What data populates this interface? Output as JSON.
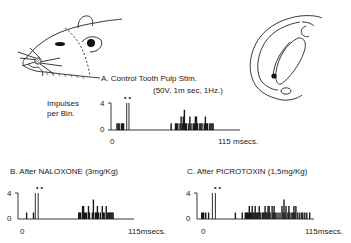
{
  "figure": {
    "panel_a": {
      "title": "A.  Control  Tooth  Pulp  Stim.",
      "params": "(50V, 1m sec, 1Hz.)",
      "ylabel_line1": "Impulses",
      "ylabel_line2": "per Bin.",
      "y_max_label": "4",
      "y_min_label": "0",
      "x_start_label": "0",
      "x_end_label": "115 msecs.",
      "stimulus_markers": "• •"
    },
    "panel_b": {
      "title": "B.  After NALOXONE  (3mg/Kg)",
      "y_max_label": "4",
      "y_min_label": "0",
      "x_start_label": "0",
      "x_end_label": "115msecs.",
      "stimulus_markers": "• •"
    },
    "panel_c": {
      "title": "C. After PICROTOXIN  (1,5mg/Kg)",
      "y_max_label": "4",
      "y_min_label": "0",
      "x_start_label": "0",
      "x_end_label": "115msecs.",
      "stimulus_markers": "• •"
    },
    "illustrations": {
      "left": "rat-head-drawing",
      "right": "brain-section-drawing"
    }
  },
  "chart_data": [
    {
      "type": "bar",
      "title": "A. Control Tooth Pulp Stim. (50V, 1m sec, 1Hz.)",
      "xlabel": "msecs",
      "ylabel": "Impulses per Bin.",
      "xlim": [
        0,
        115
      ],
      "ylim": [
        0,
        4
      ],
      "note": "Two stimulus artifacts (marked ••) reach 4; late response cluster ~55-95 msec with 1-2 impulses per bin",
      "bins_ms": [
        3,
        4,
        5,
        7,
        8,
        9,
        12,
        14,
        52,
        56,
        57,
        58,
        60,
        61,
        62,
        63,
        64,
        65,
        66,
        68,
        69,
        70,
        72,
        73,
        74,
        75,
        76,
        78,
        79,
        80,
        82,
        83,
        84,
        85,
        87,
        88,
        89,
        90
      ],
      "values": [
        1,
        1,
        1,
        1,
        1,
        1,
        4,
        4,
        1,
        1,
        1,
        1,
        1,
        2,
        1,
        2,
        3,
        1,
        1,
        1,
        2,
        1,
        1,
        1,
        2,
        2,
        1,
        1,
        1,
        1,
        1,
        2,
        1,
        1,
        1,
        1,
        1,
        1
      ]
    },
    {
      "type": "bar",
      "title": "B. After NALOXONE (3mg/Kg)",
      "xlabel": "msecs",
      "ylabel": "Impulses per Bin.",
      "xlim": [
        0,
        115
      ],
      "ylim": [
        0,
        4
      ],
      "bins_ms": [
        5,
        12,
        14,
        17,
        58,
        59,
        60,
        62,
        63,
        64,
        65,
        66,
        68,
        69,
        72,
        73,
        75,
        76,
        77,
        78,
        80,
        82,
        83,
        84,
        86,
        87,
        88,
        89,
        90,
        91,
        92,
        93
      ],
      "values": [
        1,
        1,
        4,
        4,
        1,
        1,
        1,
        2,
        2,
        1,
        1,
        1,
        2,
        1,
        1,
        3,
        1,
        1,
        2,
        1,
        1,
        2,
        1,
        1,
        2,
        1,
        1,
        1,
        1,
        1,
        1,
        1
      ]
    },
    {
      "type": "bar",
      "title": "C. After PICROTOXIN (1,5mg/Kg)",
      "xlabel": "msecs",
      "ylabel": "Impulses per Bin.",
      "xlim": [
        0,
        115
      ],
      "ylim": [
        0,
        4
      ],
      "bins_ms": [
        1,
        2,
        3,
        5,
        8,
        12,
        15,
        35,
        42,
        45,
        46,
        47,
        48,
        49,
        50,
        51,
        52,
        53,
        54,
        55,
        56,
        57,
        58,
        59,
        60,
        62,
        63,
        64,
        65,
        66,
        67,
        68,
        69,
        70,
        72,
        73,
        74,
        75,
        76,
        78,
        80,
        82,
        83,
        84,
        85,
        86,
        88,
        89,
        90,
        92,
        93,
        94,
        95,
        96,
        98,
        100,
        102,
        103,
        105,
        107,
        110
      ],
      "values": [
        1,
        1,
        1,
        1,
        1,
        4,
        4,
        1,
        1,
        1,
        1,
        1,
        1,
        2,
        1,
        1,
        2,
        1,
        1,
        2,
        1,
        1,
        1,
        2,
        1,
        1,
        1,
        1,
        2,
        1,
        1,
        2,
        2,
        1,
        2,
        1,
        2,
        1,
        1,
        1,
        1,
        2,
        1,
        3,
        1,
        2,
        1,
        2,
        1,
        1,
        1,
        2,
        1,
        2,
        1,
        1,
        1,
        1,
        1,
        1,
        1
      ]
    }
  ]
}
